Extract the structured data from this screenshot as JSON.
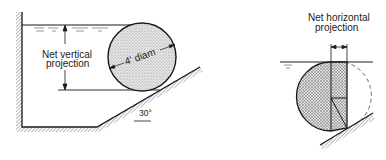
{
  "left_figure": {
    "vertical_label_line1": "Net vertical",
    "vertical_label_line2": "projection",
    "diameter_label": "4' diam",
    "angle_label": "30°"
  },
  "right_figure": {
    "horizontal_label_line1": "Net horizontal",
    "horizontal_label_line2": "projection"
  },
  "colors": {
    "line": "#1a1a1a",
    "stipple_fill": "#d8d8d8",
    "hatch": "#555555"
  }
}
